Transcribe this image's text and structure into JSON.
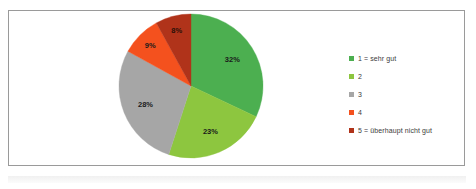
{
  "chart_data": {
    "type": "pie",
    "title": "",
    "subtitle": "",
    "xlabel": "",
    "ylabel": "",
    "grid": false,
    "legend_position": "right",
    "start_angle_deg": 0,
    "direction": "clockwise",
    "categories": [
      "1 = sehr gut",
      "2",
      "3",
      "4",
      "5 = überhaupt nicht gut"
    ],
    "values": [
      32,
      23,
      28,
      9,
      8
    ],
    "value_unit": "%",
    "data_labels": [
      "32%",
      "23%",
      "28%",
      "9%",
      "8%"
    ],
    "colors": [
      "#4caf50",
      "#8dc63f",
      "#a6a6a6",
      "#f4511e",
      "#b0331a"
    ],
    "series": [
      {
        "name": "Bewertung",
        "values": [
          32,
          23,
          28,
          9,
          8
        ]
      }
    ]
  },
  "legend": {
    "items": [
      {
        "label": "1 = sehr gut",
        "color": "#4caf50"
      },
      {
        "label": "2",
        "color": "#8dc63f"
      },
      {
        "label": "3",
        "color": "#a6a6a6"
      },
      {
        "label": "4",
        "color": "#f4511e"
      },
      {
        "label": "5 = überhaupt nicht gut",
        "color": "#b0331a"
      }
    ]
  },
  "style": {
    "frame_border_color": "#9a9a9a",
    "background_color": "#ffffff",
    "label_text_color": "#1a1a1a",
    "legend_text_color": "#3b3b3b"
  }
}
